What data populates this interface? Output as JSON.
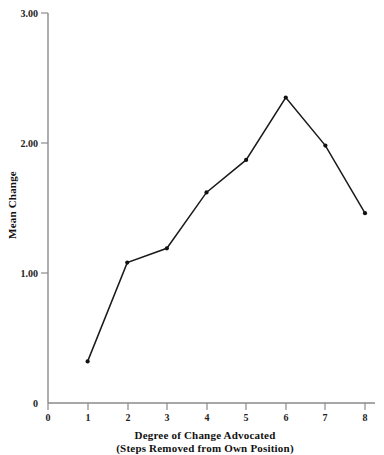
{
  "chart_data": {
    "type": "line",
    "title": "",
    "subtitle": "",
    "xlabel": "Degree of Change Advocated",
    "xlabel_line2": "(Steps Removed from Own Position)",
    "ylabel": "Mean Change",
    "x": [
      1,
      2,
      3,
      4,
      5,
      6,
      7,
      8
    ],
    "values": [
      0.32,
      1.08,
      1.19,
      1.62,
      1.87,
      2.35,
      1.98,
      1.46
    ],
    "series": [
      {
        "name": "Mean Change",
        "values": [
          0.32,
          1.08,
          1.19,
          1.62,
          1.87,
          2.35,
          1.98,
          1.46
        ]
      }
    ],
    "xlim": [
      0,
      8
    ],
    "ylim": [
      0,
      3.0
    ],
    "x_ticks": [
      0,
      1,
      2,
      3,
      4,
      5,
      6,
      7,
      8
    ],
    "x_tick_labels": [
      "0",
      "1",
      "2",
      "3",
      "4",
      "5",
      "6",
      "7",
      "8"
    ],
    "y_ticks": [
      0,
      1.0,
      2.0,
      3.0
    ],
    "y_tick_labels": [
      "0",
      "1.00",
      "2.00",
      "3.00"
    ],
    "grid": false,
    "legend": "none",
    "marker": "filled-circle",
    "line_color": "#1a1a1a",
    "axis_color": "#8a8a8a",
    "background_color": "#ffffff"
  },
  "axes": {
    "y_tick_0": "0",
    "y_tick_1": "1.00",
    "y_tick_2": "2.00",
    "y_tick_3": "3.00",
    "x_tick_0": "0",
    "x_tick_1": "1",
    "x_tick_2": "2",
    "x_tick_3": "3",
    "x_tick_4": "4",
    "x_tick_5": "5",
    "x_tick_6": "6",
    "x_tick_7": "7",
    "x_tick_8": "8"
  }
}
